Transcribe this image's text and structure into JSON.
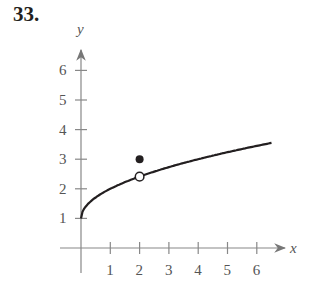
{
  "problem_number": "33.",
  "chart_data": {
    "type": "line",
    "title": "",
    "xlabel": "x",
    "ylabel": "y",
    "x_ticks": [
      "1",
      "2",
      "3",
      "4",
      "5",
      "6"
    ],
    "y_ticks": [
      "1",
      "2",
      "3",
      "4",
      "5",
      "6"
    ],
    "xlim": [
      -0.8,
      7
    ],
    "ylim": [
      -0.5,
      6.8
    ],
    "grid": false,
    "series": [
      {
        "name": "f(x) = 1 + sqrt(x)",
        "x": [
          0,
          0.25,
          0.5,
          1,
          1.5,
          2,
          2.5,
          3,
          3.5,
          4,
          4.5,
          5,
          5.5,
          6,
          6.5
        ],
        "y": [
          1,
          1.5,
          1.71,
          2,
          2.22,
          2.41,
          2.58,
          2.73,
          2.87,
          3,
          3.12,
          3.24,
          3.35,
          3.45,
          3.55
        ]
      }
    ],
    "annotations": [
      {
        "type": "open_circle",
        "x": 2,
        "y": 2.41
      },
      {
        "type": "filled_dot",
        "x": 2,
        "y": 3
      }
    ]
  }
}
